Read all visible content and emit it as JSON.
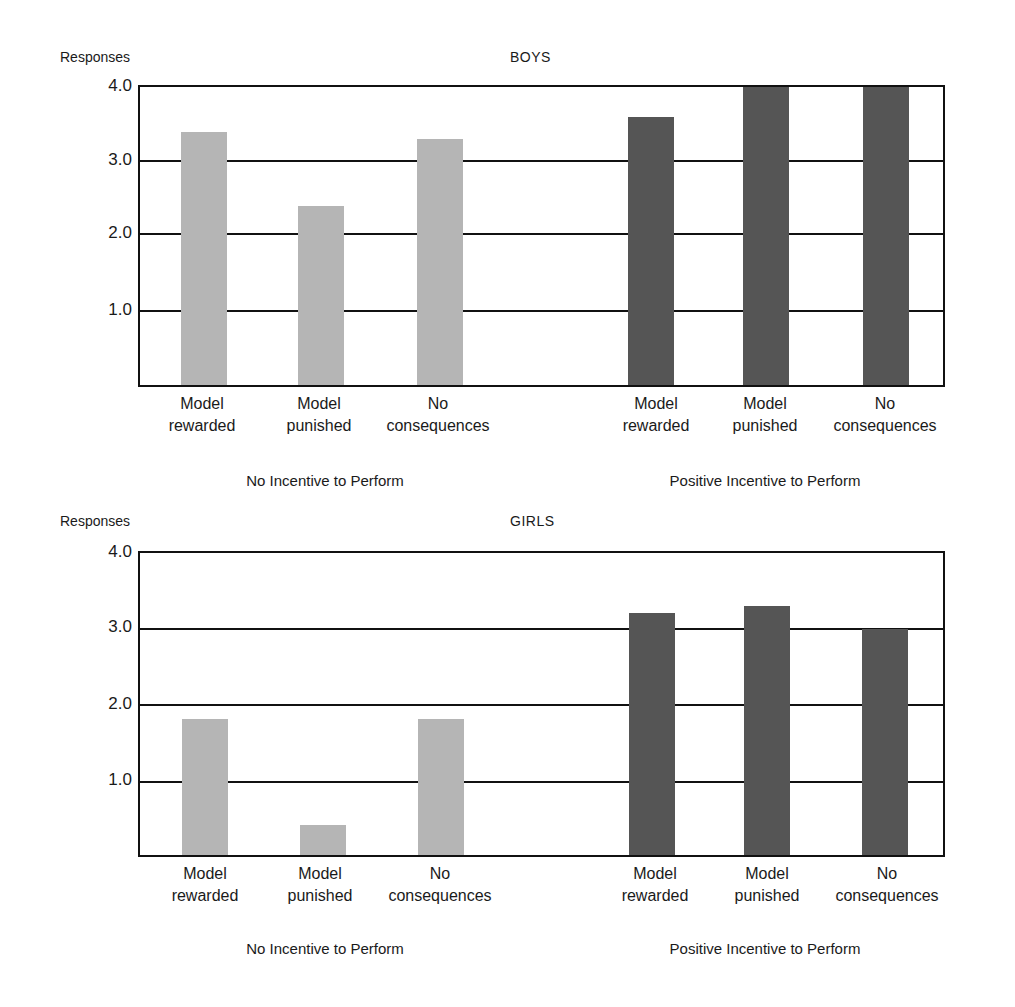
{
  "chart_data": [
    {
      "type": "bar",
      "title": "BOYS",
      "ylabel": "Responses",
      "xlabel": "",
      "ylim": [
        0,
        4.0
      ],
      "yticks": [
        "4.0",
        "3.0",
        "2.0",
        "1.0"
      ],
      "grid": true,
      "groups": [
        "No Incentive to Perform",
        "Positive Incentive to Perform"
      ],
      "categories": [
        "Model rewarded",
        "Model punished",
        "No consequences",
        "Model rewarded",
        "Model punished",
        "No consequences"
      ],
      "series": [
        {
          "name": "No Incentive to Perform",
          "color": "#b5b5b5",
          "values": [
            3.4,
            2.4,
            3.3
          ]
        },
        {
          "name": "Positive Incentive to Perform",
          "color": "#555555",
          "values": [
            3.6,
            4.0,
            4.0
          ]
        }
      ]
    },
    {
      "type": "bar",
      "title": "GIRLS",
      "ylabel": "Responses",
      "xlabel": "",
      "ylim": [
        0,
        4.0
      ],
      "yticks": [
        "4.0",
        "3.0",
        "2.0",
        "1.0"
      ],
      "grid": true,
      "groups": [
        "No Incentive to Perform",
        "Positive Incentive to Perform"
      ],
      "categories": [
        "Model rewarded",
        "Model punished",
        "No consequences",
        "Model rewarded",
        "Model punished",
        "No consequences"
      ],
      "series": [
        {
          "name": "No Incentive to Perform",
          "color": "#b5b5b5",
          "values": [
            1.8,
            0.4,
            1.8
          ]
        },
        {
          "name": "Positive Incentive to Perform",
          "color": "#555555",
          "values": [
            3.2,
            3.3,
            3.0
          ]
        }
      ]
    }
  ],
  "panels": [
    {
      "title": "BOYS",
      "ylabel": "Responses",
      "ticks": [
        "4.0",
        "3.0",
        "2.0",
        "1.0"
      ],
      "labels": [
        {
          "line1": "Model",
          "line2": "rewarded"
        },
        {
          "line1": "Model",
          "line2": "punished"
        },
        {
          "line1": "No",
          "line2": "consequences"
        },
        {
          "line1": "Model",
          "line2": "rewarded"
        },
        {
          "line1": "Model",
          "line2": "punished"
        },
        {
          "line1": "No",
          "line2": "consequences"
        }
      ],
      "groups": [
        "No Incentive to Perform",
        "Positive Incentive to Perform"
      ]
    },
    {
      "title": "GIRLS",
      "ylabel": "Responses",
      "ticks": [
        "4.0",
        "3.0",
        "2.0",
        "1.0"
      ],
      "labels": [
        {
          "line1": "Model",
          "line2": "rewarded"
        },
        {
          "line1": "Model",
          "line2": "punished"
        },
        {
          "line1": "No",
          "line2": "consequences"
        },
        {
          "line1": "Model",
          "line2": "rewarded"
        },
        {
          "line1": "Model",
          "line2": "punished"
        },
        {
          "line1": "No",
          "line2": "consequences"
        }
      ],
      "groups": [
        "No Incentive to Perform",
        "Positive Incentive to Perform"
      ]
    }
  ]
}
